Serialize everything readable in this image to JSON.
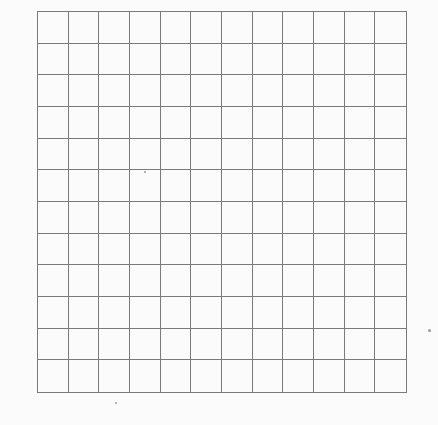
{
  "grid": {
    "rows": 12,
    "cols": 12,
    "left": 37,
    "top": 11,
    "width": 370,
    "height": 382,
    "line_color": "#7a7a7a",
    "background": "#fbfbfb"
  },
  "specks": [
    {
      "x": 429,
      "y": 330,
      "size": 3
    },
    {
      "x": 116,
      "y": 403,
      "size": 2
    },
    {
      "x": 145,
      "y": 172,
      "size": 2
    }
  ]
}
